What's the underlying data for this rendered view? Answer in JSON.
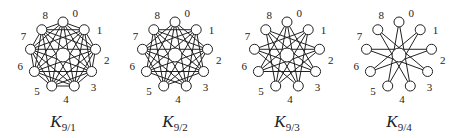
{
  "figure": {
    "node_labels": [
      "0",
      "1",
      "2",
      "3",
      "4",
      "5",
      "6",
      "7",
      "8"
    ],
    "graphs": [
      {
        "id": "k9-1",
        "caption_main": "K",
        "caption_sub": "9/1",
        "cx": 63,
        "min_step": 1
      },
      {
        "id": "k9-2",
        "caption_main": "K",
        "caption_sub": "9/2",
        "cx": 175,
        "min_step": 2
      },
      {
        "id": "k9-3",
        "caption_main": "K",
        "caption_sub": "9/3",
        "cx": 287,
        "min_step": 3
      },
      {
        "id": "k9-4",
        "caption_main": "K",
        "caption_sub": "9/4",
        "cx": 399,
        "min_step": 4
      }
    ],
    "cy": 55,
    "radius": 33,
    "node_radius": 5,
    "hub_radius": 7,
    "label_radius": 44,
    "stroke": "#222222"
  }
}
